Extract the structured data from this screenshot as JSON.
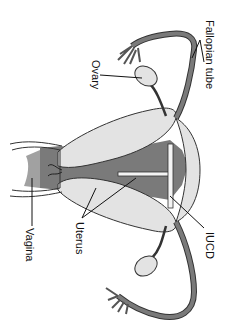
{
  "diagram": {
    "orientation": "rotated 90 degrees clockwise",
    "labels": {
      "fallopian_tube": "Fallopian tube",
      "ovary": "Ovary",
      "iucd": "IUCD",
      "uterus": "Uterus",
      "vagina": "Vagina"
    },
    "colors": {
      "background": "#ffffff",
      "outline": "#333333",
      "light_tissue": "#e3e3e3",
      "dark_tissue": "#7a7a7a",
      "device": "#f4f4f4",
      "text": "#111111"
    }
  }
}
